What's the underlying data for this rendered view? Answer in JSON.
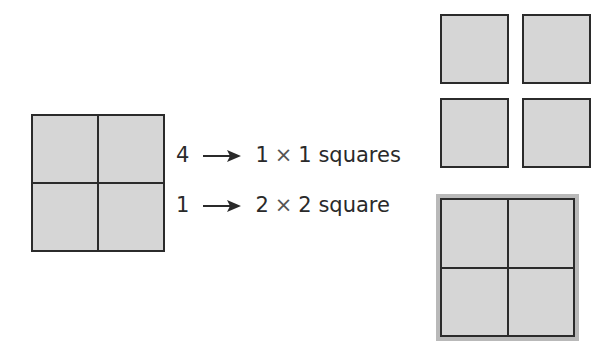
{
  "diagram": {
    "source_grid": {
      "rows": 2,
      "cols": 2,
      "fill": "#d6d6d6",
      "stroke": "#2b2b2b"
    },
    "rows": [
      {
        "count": "4",
        "size_a": "1",
        "times": "×",
        "size_b": "1",
        "noun": "squares"
      },
      {
        "count": "1",
        "size_a": "2",
        "times": "×",
        "size_b": "2",
        "noun": "square"
      }
    ],
    "results": {
      "unit_squares": {
        "count": 4,
        "fill": "#d6d6d6",
        "stroke": "#2b2b2b"
      },
      "big_square": {
        "size": "2 × 2",
        "fill": "#d6d6d6",
        "highlight": "#b9b9b9",
        "stroke": "#2b2b2b"
      }
    },
    "icons": {
      "arrow": "right-arrow-icon"
    }
  }
}
